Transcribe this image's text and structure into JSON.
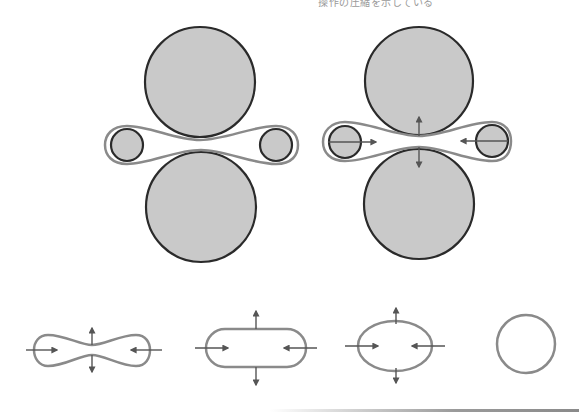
{
  "caption": {
    "text": "操作の圧縮を示している"
  },
  "colors": {
    "roller_fill": "#c9c9c9",
    "roller_stroke": "#2a2a2a",
    "belt_stroke": "#8a8a8a",
    "arrow": "#555555",
    "background": "#ffffff"
  },
  "diagram": {
    "panels": [
      {
        "name": "rollers-without-forces",
        "large_rollers": [
          {
            "cx": 200,
            "cy": 82,
            "r": 55
          },
          {
            "cx": 201,
            "cy": 207,
            "r": 55
          }
        ],
        "small_rollers": [
          {
            "cx": 127,
            "cy": 145,
            "r": 16
          },
          {
            "cx": 276,
            "cy": 145,
            "r": 16
          }
        ]
      },
      {
        "name": "rollers-with-forces",
        "large_rollers": [
          {
            "cx": 419,
            "cy": 81,
            "r": 54
          },
          {
            "cx": 419,
            "cy": 204,
            "r": 55
          }
        ],
        "small_rollers": [
          {
            "cx": 345,
            "cy": 142,
            "r": 16
          },
          {
            "cx": 492,
            "cy": 141,
            "r": 16
          }
        ]
      }
    ],
    "shape_sequence": [
      "pinched-loop",
      "stadium",
      "ellipse",
      "circle"
    ]
  }
}
